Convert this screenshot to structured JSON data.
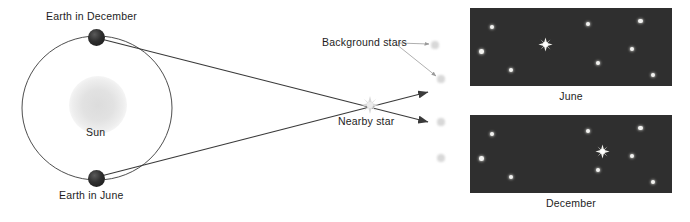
{
  "figure": {
    "background_color": "#ffffff"
  },
  "labels": {
    "earth_december": "Earth in December",
    "earth_june": "Earth in June",
    "sun": "Sun",
    "background_stars": "Background stars",
    "nearby_star": "Nearby star"
  },
  "panels": [
    {
      "caption": "June",
      "x": 470,
      "y": 8,
      "width": 202,
      "height": 78,
      "background_color": "#2f2f2f",
      "nearby_star": {
        "x": 0.375,
        "y": 0.47,
        "size": 15
      },
      "background_stars": [
        {
          "x": 0.108,
          "y": 0.24,
          "r": 2.1
        },
        {
          "x": 0.058,
          "y": 0.56,
          "r": 2.3
        },
        {
          "x": 0.205,
          "y": 0.79,
          "r": 2.1
        },
        {
          "x": 0.585,
          "y": 0.21,
          "r": 2.1
        },
        {
          "x": 0.635,
          "y": 0.7,
          "r": 2.0
        },
        {
          "x": 0.845,
          "y": 0.17,
          "r": 2.3
        },
        {
          "x": 0.802,
          "y": 0.52,
          "r": 2.0
        },
        {
          "x": 0.905,
          "y": 0.86,
          "r": 2.3
        }
      ]
    },
    {
      "caption": "December",
      "x": 470,
      "y": 115,
      "width": 202,
      "height": 78,
      "background_color": "#2f2f2f",
      "nearby_star": {
        "x": 0.655,
        "y": 0.47,
        "size": 15
      },
      "background_stars": [
        {
          "x": 0.108,
          "y": 0.24,
          "r": 2.1
        },
        {
          "x": 0.058,
          "y": 0.56,
          "r": 2.3
        },
        {
          "x": 0.205,
          "y": 0.79,
          "r": 2.1
        },
        {
          "x": 0.585,
          "y": 0.21,
          "r": 2.1
        },
        {
          "x": 0.635,
          "y": 0.7,
          "r": 2.0
        },
        {
          "x": 0.845,
          "y": 0.17,
          "r": 2.3
        },
        {
          "x": 0.802,
          "y": 0.52,
          "r": 2.0
        },
        {
          "x": 0.905,
          "y": 0.86,
          "r": 2.3
        }
      ]
    }
  ],
  "scene": {
    "orbit": {
      "cx": 97,
      "cy": 108,
      "rx": 75,
      "ry": 72
    },
    "sun": {
      "cx": 98,
      "cy": 105,
      "r": 29
    },
    "earth_december": {
      "cx": 96,
      "cy": 37,
      "r": 8.5
    },
    "earth_june": {
      "cx": 96,
      "cy": 178,
      "r": 8.5
    },
    "nearby_star": {
      "cx": 370,
      "cy": 105,
      "size": 17
    },
    "faint_stars": [
      {
        "cx": 435,
        "cy": 45,
        "r": 3.6
      },
      {
        "cx": 441,
        "cy": 79,
        "r": 3.6
      },
      {
        "cx": 441,
        "cy": 122,
        "r": 3.6
      },
      {
        "cx": 441,
        "cy": 158,
        "r": 3.8
      }
    ],
    "sight_lines": [
      {
        "from": "earth_december",
        "to": "arrow_lower",
        "x1": 101,
        "y1": 39,
        "x2": 428,
        "y2": 122
      },
      {
        "from": "earth_june",
        "to": "arrow_upper",
        "x1": 101,
        "y1": 176,
        "x2": 428,
        "y2": 92
      }
    ],
    "leader_lines": [
      {
        "x1": 398,
        "y1": 43,
        "x2": 430,
        "y2": 44
      },
      {
        "x1": 396,
        "y1": 44,
        "x2": 437,
        "y2": 76
      }
    ]
  },
  "colors": {
    "line": "#3a3a3a",
    "text": "#1d1d1d",
    "panel_bg": "#2f2f2f",
    "star_bright": "#f2f2f0",
    "star_faint": "#d8d8d8",
    "earth": "#1e1e1e",
    "sun_glow": "#dcdcdc"
  }
}
